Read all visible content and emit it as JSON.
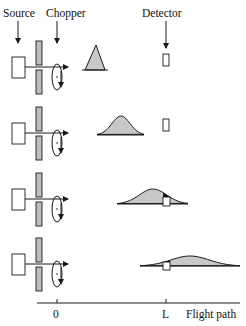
{
  "labels": {
    "source": "Source",
    "chopper": "Chopper",
    "detector": "Detector"
  },
  "axis": {
    "tick_origin": "0",
    "tick_detector": "L",
    "axis_title": "Flight path"
  },
  "colors": {
    "pulse_fill": "#c8c8c8",
    "plate_fill": "#bdbdbd",
    "detected_fill": "#111111",
    "line": "#1a1a1a"
  },
  "geometry": {
    "source_x": 18,
    "chopper_x": 57,
    "detector_x": 166,
    "axis_y": 303,
    "axis_x_start": 37,
    "axis_x_end": 240
  },
  "rows": [
    {
      "beam_y": 67,
      "pulse_shape": "triangle",
      "pulse": {
        "x_start": 85,
        "x_peak": 96,
        "x_end": 105,
        "y_base": 70,
        "y_peak": 45
      },
      "detector": {
        "x": 163,
        "y": 54,
        "w": 6,
        "h": 12
      },
      "detected_portion": false
    },
    {
      "beam_y": 133,
      "pulse_shape": "gaussian",
      "pulse": {
        "x_start": 97,
        "x_peak": 121,
        "x_end": 144,
        "y_base": 135,
        "y_peak": 116
      },
      "detector": {
        "x": 163,
        "y": 119,
        "w": 6,
        "h": 12
      },
      "detected_portion": false
    },
    {
      "beam_y": 199,
      "pulse_shape": "gaussian",
      "pulse": {
        "x_start": 117,
        "x_peak": 153,
        "x_end": 188,
        "y_base": 204,
        "y_peak": 189
      },
      "detector": {
        "x": 163,
        "y": 197,
        "w": 7,
        "h": 9
      },
      "detected_portion": true
    },
    {
      "beam_y": 264,
      "pulse_shape": "gaussian",
      "pulse": {
        "x_start": 140,
        "x_peak": 190,
        "x_end": 240,
        "y_base": 266,
        "y_peak": 256
      },
      "detector": {
        "x": 163,
        "y": 262,
        "w": 7,
        "h": 8
      },
      "detected_portion": true
    }
  ]
}
